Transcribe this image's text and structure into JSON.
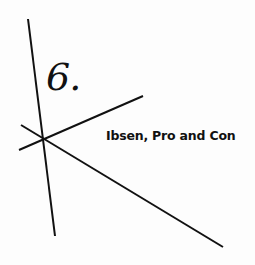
{
  "chapter": {
    "number": "6.",
    "title": "Ibsen, Pro and Con"
  },
  "colors": {
    "ink": "#111111",
    "paper": "#fdfdfd"
  }
}
